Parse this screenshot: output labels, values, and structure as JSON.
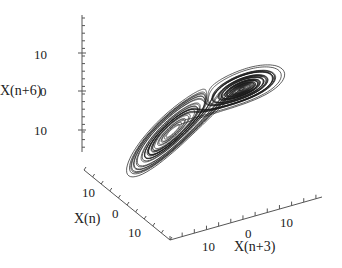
{
  "chart_data": {
    "type": "line",
    "subtype": "3d-phase-space-trajectory",
    "title": "",
    "axes": {
      "z": {
        "label": "X(n+6)",
        "ticks": [
          "10",
          "0",
          "10"
        ]
      },
      "x": {
        "label": "X(n)",
        "ticks": [
          "10",
          "0",
          "10"
        ]
      },
      "y": {
        "label": "X(n+3)",
        "ticks": [
          "10",
          "0",
          "10"
        ]
      }
    },
    "series": [
      {
        "name": "trajectory",
        "color": "#1a1a1a",
        "lobes": [
          {
            "name": "left-lobe",
            "center_px": [
              160,
              140
            ]
          },
          {
            "name": "right-lobe",
            "center_px": [
              255,
              75
            ]
          }
        ]
      }
    ],
    "grid": false,
    "legend": null
  },
  "labels": {
    "z_axis": "X(n+6)",
    "x_axis": "X(n)",
    "y_axis": "X(n+3)",
    "z_ticks": [
      "10",
      "0",
      "10"
    ],
    "x_ticks": [
      "10",
      "0",
      "10"
    ],
    "y_ticks": [
      "10",
      "0",
      "10"
    ]
  },
  "colors": {
    "line": "#1a1a1a",
    "axis": "#444444",
    "background": "#ffffff"
  }
}
